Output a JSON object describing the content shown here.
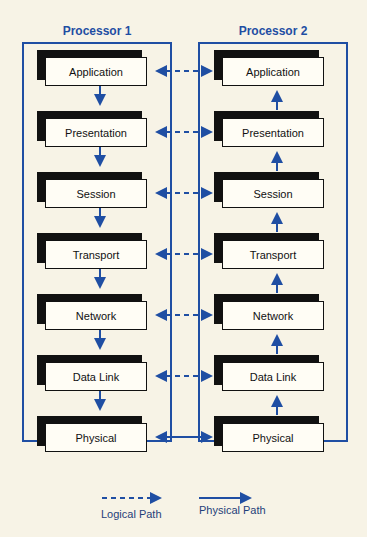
{
  "processors": [
    {
      "title": "Processor 1"
    },
    {
      "title": "Processor 2"
    }
  ],
  "layers": [
    "Application",
    "Presentation",
    "Session",
    "Transport",
    "Network",
    "Data Link",
    "Physical"
  ],
  "legend": {
    "logical": "Logical Path",
    "physical": "Physical Path"
  },
  "colors": {
    "accent": "#1f4ea3",
    "background": "#f7f3e6"
  }
}
